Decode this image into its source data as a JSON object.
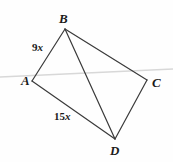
{
  "figure": {
    "type": "geometry-diagram",
    "shape": "quadrilateral",
    "background_color": "#fefefe",
    "stroke_color": "#3a3a3a",
    "guide_line_color": "#d8d8d8",
    "label_color": "#1b1b1b",
    "vertices": [
      {
        "id": "B",
        "label": "B",
        "x": 65,
        "y": 29
      },
      {
        "id": "A",
        "label": "A",
        "x": 32,
        "y": 81
      },
      {
        "id": "C",
        "label": "C",
        "x": 147,
        "y": 80
      },
      {
        "id": "D",
        "label": "D",
        "x": 115,
        "y": 139
      }
    ],
    "edges": [
      {
        "id": "AB",
        "from": "A",
        "to": "B",
        "label": "9x",
        "kind": "side"
      },
      {
        "id": "BC",
        "from": "B",
        "to": "C",
        "label": "",
        "kind": "side"
      },
      {
        "id": "CD",
        "from": "C",
        "to": "D",
        "label": "",
        "kind": "side"
      },
      {
        "id": "AD",
        "from": "A",
        "to": "D",
        "label": "15x",
        "kind": "side"
      },
      {
        "id": "BD",
        "from": "B",
        "to": "D",
        "label": "",
        "kind": "diagonal"
      }
    ],
    "guide_line": {
      "id": "horizontal-guide",
      "x1": 0,
      "y1": 77,
      "x2": 173,
      "y2": 69
    },
    "measures": [
      {
        "id": "AB",
        "number": "9",
        "variable": "x",
        "text": "9x"
      },
      {
        "id": "AD",
        "number": "15",
        "variable": "x",
        "text": "15x"
      }
    ]
  }
}
